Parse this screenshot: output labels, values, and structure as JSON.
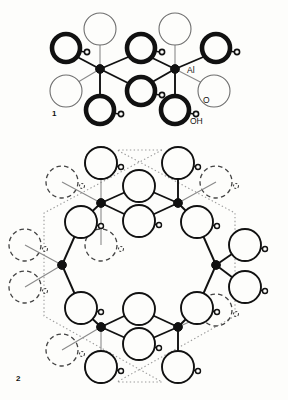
{
  "figure": {
    "background_color": "#fdfdfb",
    "ink_color": "#111111"
  },
  "legend": {
    "al_label": "Al",
    "o_label": "O",
    "oh_label": "OH",
    "al_label_pos": {
      "x": 187,
      "y": 73
    },
    "o_label_pos": {
      "x": 203,
      "y": 103
    },
    "oh_label_pos": {
      "x": 190,
      "y": 124
    }
  },
  "panels": [
    {
      "id": "panel-1",
      "number": "1",
      "number_pos": {
        "x": 52,
        "y": 116
      },
      "description": "Edge-sharing pair of aluminium octahedra",
      "al_centers": [
        {
          "x": 100,
          "y": 69
        },
        {
          "x": 175,
          "y": 69
        }
      ],
      "bonds_thick": [
        {
          "x1": 100,
          "y1": 69,
          "x2": 68,
          "y2": 52
        },
        {
          "x1": 100,
          "y1": 69,
          "x2": 140,
          "y2": 52
        },
        {
          "x1": 100,
          "y1": 69,
          "x2": 100,
          "y2": 99
        },
        {
          "x1": 100,
          "y1": 69,
          "x2": 140,
          "y2": 89
        },
        {
          "x1": 175,
          "y1": 69,
          "x2": 140,
          "y2": 52
        },
        {
          "x1": 175,
          "y1": 69,
          "x2": 215,
          "y2": 52
        },
        {
          "x1": 175,
          "y1": 69,
          "x2": 175,
          "y2": 99
        },
        {
          "x1": 175,
          "y1": 69,
          "x2": 140,
          "y2": 89
        }
      ],
      "bonds_thin": [
        {
          "x1": 100,
          "y1": 69,
          "x2": 100,
          "y2": 37
        },
        {
          "x1": 100,
          "y1": 69,
          "x2": 68,
          "y2": 88
        },
        {
          "x1": 175,
          "y1": 69,
          "x2": 175,
          "y2": 37
        },
        {
          "x1": 175,
          "y1": 69,
          "x2": 212,
          "y2": 88
        }
      ],
      "oxygen_circles": [
        {
          "x": 100,
          "y": 29,
          "r": 16
        },
        {
          "x": 66,
          "y": 91,
          "r": 16
        },
        {
          "x": 175,
          "y": 29,
          "r": 16
        },
        {
          "x": 214,
          "y": 91,
          "r": 16
        }
      ],
      "hydroxyl_circles": [
        {
          "x": 66,
          "y": 48,
          "r": 14,
          "h": {
            "x": 87,
            "y": 52
          }
        },
        {
          "x": 141,
          "y": 48,
          "r": 14,
          "h": {
            "x": 162,
            "y": 52
          }
        },
        {
          "x": 216,
          "y": 48,
          "r": 14,
          "h": {
            "x": 237,
            "y": 52
          }
        },
        {
          "x": 141,
          "y": 91,
          "r": 14,
          "h": {
            "x": 162,
            "y": 95
          }
        },
        {
          "x": 100,
          "y": 110,
          "r": 14,
          "h": {
            "x": 121,
            "y": 114
          }
        },
        {
          "x": 175,
          "y": 110,
          "r": 14,
          "h": {
            "x": 196,
            "y": 114
          }
        }
      ]
    },
    {
      "id": "panel-2",
      "number": "2",
      "number_pos": {
        "x": 16,
        "y": 381
      },
      "description": "Hexagonal ring of six aluminium centres with dotted unit-cell outline and dashed symmetry-equivalent sites",
      "al_centers": [
        {
          "x": 101,
          "y": 203
        },
        {
          "x": 178,
          "y": 203
        },
        {
          "x": 62,
          "y": 265
        },
        {
          "x": 216,
          "y": 265
        },
        {
          "x": 101,
          "y": 327
        },
        {
          "x": 178,
          "y": 327
        }
      ],
      "ring_bridge_circles": [
        {
          "x": 139,
          "y": 186,
          "r": 16
        },
        {
          "x": 139,
          "y": 221,
          "r": 16
        },
        {
          "x": 81,
          "y": 222,
          "r": 16
        },
        {
          "x": 197,
          "y": 222,
          "r": 16
        },
        {
          "x": 81,
          "y": 308,
          "r": 16
        },
        {
          "x": 197,
          "y": 308,
          "r": 16
        },
        {
          "x": 139,
          "y": 309,
          "r": 16
        },
        {
          "x": 139,
          "y": 344,
          "r": 16
        }
      ],
      "outer_circles": [
        {
          "x": 101,
          "y": 163,
          "r": 16
        },
        {
          "x": 178,
          "y": 163,
          "r": 16
        },
        {
          "x": 101,
          "y": 367,
          "r": 16
        },
        {
          "x": 178,
          "y": 367,
          "r": 16
        },
        {
          "x": 245,
          "y": 245,
          "r": 16
        },
        {
          "x": 245,
          "y": 287,
          "r": 16
        }
      ],
      "dotted_hexagon": [
        {
          "x": 162,
          "y": 150
        },
        {
          "x": 44,
          "y": 213
        },
        {
          "x": 44,
          "y": 316
        },
        {
          "x": 162,
          "y": 382
        }
      ],
      "dashed_circles": [
        {
          "x": 101,
          "y": 163,
          "r": 16
        },
        {
          "x": 62,
          "y": 182,
          "r": 16
        },
        {
          "x": 25,
          "y": 245,
          "r": 16
        },
        {
          "x": 25,
          "y": 287,
          "r": 16
        },
        {
          "x": 101,
          "y": 245,
          "r": 16
        },
        {
          "x": 62,
          "y": 350,
          "r": 16
        },
        {
          "x": 101,
          "y": 367,
          "r": 16
        },
        {
          "x": 216,
          "y": 182,
          "r": 16
        },
        {
          "x": 216,
          "y": 310,
          "r": 16
        }
      ]
    }
  ]
}
